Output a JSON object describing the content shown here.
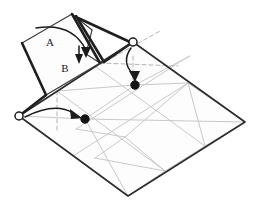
{
  "diagram": {
    "type": "origami-fold-step",
    "background_color": "#ffffff",
    "labels": [
      {
        "id": "label-a",
        "text": "A",
        "x": 50,
        "y": 43
      },
      {
        "id": "label-b",
        "text": "B",
        "x": 65,
        "y": 69
      }
    ],
    "colors": {
      "outline": "#2b2b2b",
      "fold_edge": "#1f1f1f",
      "crease_light": "#c9c9c9",
      "crease_hidden": "#b4b4b4",
      "arrow": "#1c1c1c",
      "dot_filled": "#141414",
      "dot_open_fill": "#ffffff",
      "face_fill": "#fdfdfd"
    },
    "markers": {
      "reference_points_open": [
        {
          "id": "open-circle-left",
          "x": 19,
          "y": 116,
          "r": 4
        },
        {
          "id": "open-circle-top-right",
          "x": 133,
          "y": 42,
          "r": 4
        }
      ],
      "target_points_filled": [
        {
          "id": "filled-dot-left",
          "x": 85,
          "y": 119,
          "r": 4.2
        },
        {
          "id": "filled-dot-right",
          "x": 135,
          "y": 85,
          "r": 4.2
        }
      ]
    },
    "arrows": [
      {
        "id": "arrow-left-to-dot",
        "kind": "curved",
        "direction": "right"
      },
      {
        "id": "arrow-top-right-to-dot",
        "kind": "curved",
        "direction": "down"
      },
      {
        "id": "arrow-flap-a-over",
        "kind": "curved",
        "direction": "down-right"
      },
      {
        "id": "arrow-small-down",
        "kind": "straight",
        "direction": "down"
      }
    ],
    "base_sheet": {
      "shape": "parallelogram",
      "vertices": [
        {
          "x": 19,
          "y": 116
        },
        {
          "x": 133,
          "y": 42
        },
        {
          "x": 245,
          "y": 122
        },
        {
          "x": 128,
          "y": 196
        }
      ]
    },
    "grid": {
      "columns": 3,
      "rows": 2,
      "diagonals": true
    }
  }
}
